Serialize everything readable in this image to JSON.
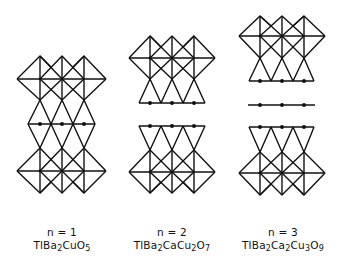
{
  "figure": {
    "stroke_color": "#111111",
    "background": "#ffffff"
  },
  "structures": [
    {
      "n_label": "n = 1",
      "formula_parts": [
        {
          "text": "TlBa",
          "sub": "2"
        },
        {
          "text": "CuO",
          "sub": "5"
        }
      ],
      "formula_plain": "TlBa2CuO5",
      "layers": [
        "octahedra",
        "TlO-diamonds-with-atoms",
        "octahedra"
      ]
    },
    {
      "n_label": "n = 2",
      "formula_parts": [
        {
          "text": "TlBa",
          "sub": "2"
        },
        {
          "text": "CaCu",
          "sub": "2"
        },
        {
          "text": "O",
          "sub": "7"
        }
      ],
      "formula_plain": "TlBa2CaCu2O7",
      "layers": [
        "octahedra",
        "pyramids-with-atoms",
        "gap",
        "inverted-pyramids-with-atoms",
        "octahedra"
      ]
    },
    {
      "n_label": "n = 3",
      "formula_parts": [
        {
          "text": "TlBa",
          "sub": "2"
        },
        {
          "text": "Ca",
          "sub": "2"
        },
        {
          "text": "Cu",
          "sub": "3"
        },
        {
          "text": "O",
          "sub": "9"
        }
      ],
      "formula_plain": "TlBa2Ca2Cu3O9",
      "layers": [
        "octahedra",
        "pyramids-with-atoms",
        "CuO2-plane-with-atoms",
        "inverted-pyramids-with-atoms",
        "octahedra"
      ]
    }
  ]
}
